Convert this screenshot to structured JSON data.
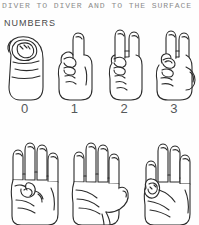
{
  "page": {
    "running_title": "DIVER TO DIVER AND TO THE SURFACE",
    "section_heading": "NUMBERS",
    "background_color": "#fefefe",
    "ink_color": "#2b2b2b",
    "caption_color": "#55585a",
    "heading_color": "#4a4a4a",
    "running_title_color": "#8d8d8d"
  },
  "rows": [
    {
      "name": "numbers-row-zero-to-three",
      "figures": [
        {
          "icon": "hand-signal-zero-icon",
          "value": "0",
          "description": "closed fist with thumb and index finger forming an O"
        },
        {
          "icon": "hand-signal-one-icon",
          "value": "1",
          "description": "index finger extended upward"
        },
        {
          "icon": "hand-signal-two-icon",
          "value": "2",
          "description": "index and middle fingers extended"
        },
        {
          "icon": "hand-signal-three-icon",
          "value": "3",
          "description": "index, middle and ring fingers extended with thumb out"
        }
      ],
      "captions": [
        "0",
        "1",
        "2",
        "3"
      ]
    },
    {
      "name": "numbers-row-four-to-six",
      "figures": [
        {
          "icon": "hand-signal-four-icon",
          "value": "4",
          "description": "four fingers extended with thumb folded across palm"
        },
        {
          "icon": "hand-signal-five-icon",
          "value": "5",
          "description": "open hand, all five fingers extended"
        },
        {
          "icon": "hand-signal-six-icon",
          "value": "6",
          "description": "four fingers extended with thumb touching little finger"
        }
      ],
      "captions": []
    }
  ]
}
